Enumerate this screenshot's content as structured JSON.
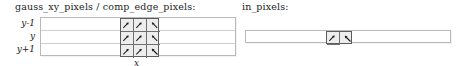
{
  "figure": {
    "type": "diagram"
  },
  "panels": [
    {
      "id": "left",
      "title": "gauss_xy_pixels / comp_edge_pixels:",
      "row_labels": [
        "y-1",
        "y",
        "y+1"
      ],
      "axis_caption": "x",
      "rows": 3,
      "highlight": {
        "cols": 3,
        "rows": 3,
        "cells": [
          [
            {
              "glyph": "arrow-up-right"
            },
            {
              "glyph": "arrow-up-right"
            },
            {
              "glyph": "arrow-up-left"
            }
          ],
          [
            {
              "glyph": "arrow-up-right"
            },
            {
              "glyph": "arrow-up-right"
            },
            {
              "glyph": "arrow-up-left"
            }
          ],
          [
            {
              "glyph": "arrow-up-right"
            },
            {
              "glyph": "arrow-up-right"
            },
            {
              "glyph": "arrow-up-left"
            }
          ]
        ]
      }
    },
    {
      "id": "right",
      "title": "in_pixels:",
      "row_labels": [],
      "axis_caption": "x",
      "rows": 1,
      "highlight": {
        "cols": 2,
        "rows": 1,
        "cells": [
          [
            {
              "glyph": "arrow-up-right"
            },
            {
              "glyph": "arrow-up-left"
            }
          ]
        ]
      }
    }
  ],
  "colors": {
    "background": "#ffffff",
    "grid_border": "#b9b9b9",
    "grid_rule": "#cfcfcf",
    "highlight_fill": "#ededed",
    "highlight_border": "#5c5c5c",
    "cell_rule": "#6f6f6f",
    "text": "#1d1d1d"
  }
}
